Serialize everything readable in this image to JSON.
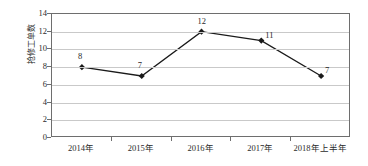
{
  "chart_data": {
    "type": "line",
    "title": "",
    "xlabel": "",
    "ylabel": "抢修工单数",
    "categories": [
      "2014年",
      "2015年",
      "2016年",
      "2017年",
      "2018年上半年"
    ],
    "values": [
      8,
      7,
      12,
      11,
      7
    ],
    "data_labels": [
      "8",
      "7",
      "12",
      "11",
      "7"
    ],
    "ylim": [
      0,
      14
    ],
    "ytick_labels": [
      "0",
      "2",
      "4",
      "6",
      "8",
      "10",
      "12",
      "14"
    ],
    "ytick_values": [
      0,
      2,
      4,
      6,
      8,
      10,
      12,
      14
    ],
    "grid": true,
    "legend": "none",
    "series_color": "#1a1a1a",
    "marker": "diamond",
    "gridline_color": "#c9c9c9",
    "axis_color": "#6e6e6e",
    "background": "#ffffff"
  }
}
